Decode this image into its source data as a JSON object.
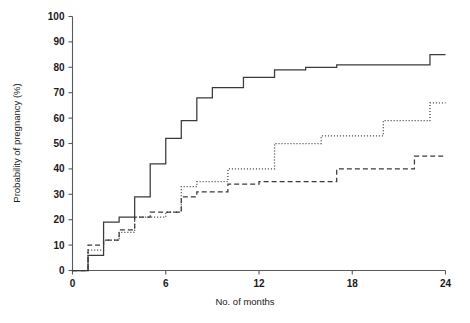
{
  "chart_data": {
    "type": "line",
    "subtype": "step-kaplan-meier-cumulative-incidence",
    "title": "",
    "xlabel": "No. of months",
    "ylabel": "Probability of pregnancy (%)",
    "xlim": [
      0,
      24
    ],
    "ylim": [
      0,
      100
    ],
    "xticks": [
      0,
      6,
      12,
      18,
      24
    ],
    "xtick_labels": [
      "0",
      "6",
      "12",
      "18",
      "24"
    ],
    "yticks": [
      0,
      10,
      20,
      30,
      40,
      50,
      60,
      70,
      80,
      90,
      100
    ],
    "ytick_labels": [
      "0",
      "10",
      "20",
      "30",
      "40",
      "50",
      "60",
      "70",
      "80",
      "90",
      "100"
    ],
    "grid": false,
    "legend": "none",
    "line_color": "#3a3a3a",
    "axis_color": "#58595b",
    "series": [
      {
        "name": "solid",
        "style": "solid",
        "dash": "none",
        "x": [
          0,
          1,
          1,
          2,
          2,
          3,
          3,
          4,
          4,
          5,
          5,
          6,
          6,
          7,
          7,
          8,
          8,
          9,
          9,
          11,
          11,
          13,
          13,
          15,
          15,
          17,
          17,
          23,
          23,
          24
        ],
        "y": [
          0,
          0,
          6,
          6,
          19,
          19,
          21,
          21,
          29,
          29,
          42,
          42,
          52,
          52,
          59,
          59,
          68,
          68,
          72,
          72,
          76,
          76,
          79,
          79,
          80,
          80,
          81,
          81,
          85,
          85
        ],
        "points": [
          {
            "month": 0,
            "value": 0
          },
          {
            "month": 1,
            "value": 6
          },
          {
            "month": 2,
            "value": 19
          },
          {
            "month": 3,
            "value": 21
          },
          {
            "month": 4,
            "value": 29
          },
          {
            "month": 5,
            "value": 42
          },
          {
            "month": 6,
            "value": 52
          },
          {
            "month": 7,
            "value": 59
          },
          {
            "month": 8,
            "value": 68
          },
          {
            "month": 9,
            "value": 72
          },
          {
            "month": 11,
            "value": 76
          },
          {
            "month": 13,
            "value": 79
          },
          {
            "month": 15,
            "value": 80
          },
          {
            "month": 17,
            "value": 81
          },
          {
            "month": 23,
            "value": 85
          },
          {
            "month": 24,
            "value": 85
          }
        ]
      },
      {
        "name": "dotted",
        "style": "dotted",
        "dash": "1,2",
        "x": [
          0,
          1,
          1,
          2,
          2,
          3,
          3,
          4,
          4,
          6,
          6,
          7,
          7,
          8,
          8,
          10,
          10,
          13,
          13,
          16,
          16,
          20,
          20,
          23,
          23,
          24
        ],
        "y": [
          0,
          0,
          8,
          8,
          12,
          12,
          15,
          15,
          21,
          21,
          23,
          23,
          33,
          33,
          35,
          35,
          40,
          40,
          50,
          50,
          53,
          53,
          59,
          59,
          66,
          66
        ],
        "points": [
          {
            "month": 0,
            "value": 0
          },
          {
            "month": 1,
            "value": 8
          },
          {
            "month": 2,
            "value": 12
          },
          {
            "month": 3,
            "value": 15
          },
          {
            "month": 4,
            "value": 21
          },
          {
            "month": 6,
            "value": 23
          },
          {
            "month": 7,
            "value": 33
          },
          {
            "month": 8,
            "value": 35
          },
          {
            "month": 10,
            "value": 40
          },
          {
            "month": 13,
            "value": 50
          },
          {
            "month": 16,
            "value": 53
          },
          {
            "month": 20,
            "value": 59
          },
          {
            "month": 23,
            "value": 66
          },
          {
            "month": 24,
            "value": 66
          }
        ]
      },
      {
        "name": "dashed",
        "style": "dashed",
        "dash": "5,3",
        "x": [
          0,
          1,
          1,
          2,
          2,
          3,
          3,
          4,
          4,
          5,
          5,
          7,
          7,
          8,
          8,
          10,
          10,
          12,
          12,
          17,
          17,
          22,
          22,
          24
        ],
        "y": [
          0,
          0,
          10,
          10,
          12,
          12,
          16,
          16,
          21,
          21,
          23,
          23,
          29,
          29,
          31,
          31,
          34,
          34,
          35,
          35,
          40,
          40,
          45,
          45
        ],
        "points": [
          {
            "month": 0,
            "value": 0
          },
          {
            "month": 1,
            "value": 10
          },
          {
            "month": 2,
            "value": 12
          },
          {
            "month": 3,
            "value": 16
          },
          {
            "month": 4,
            "value": 21
          },
          {
            "month": 5,
            "value": 23
          },
          {
            "month": 7,
            "value": 29
          },
          {
            "month": 8,
            "value": 31
          },
          {
            "month": 10,
            "value": 34
          },
          {
            "month": 12,
            "value": 35
          },
          {
            "month": 17,
            "value": 40
          },
          {
            "month": 22,
            "value": 45
          },
          {
            "month": 24,
            "value": 45
          }
        ]
      }
    ]
  }
}
